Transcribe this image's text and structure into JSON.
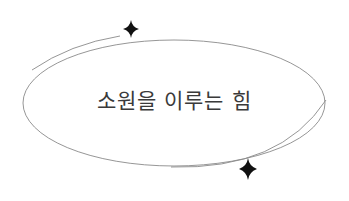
{
  "title": "소원을 이루는 힘",
  "colors": {
    "background": "#ffffff",
    "text": "#3a3a3a",
    "line": "#8a8a8a",
    "sparkle": "#111111"
  },
  "decorations": {
    "ellipse": "oval-frame",
    "outer_arcs": [
      "top-left-arc",
      "bottom-right-arc"
    ],
    "sparkles": [
      "sparkle-top",
      "sparkle-bottom"
    ]
  }
}
